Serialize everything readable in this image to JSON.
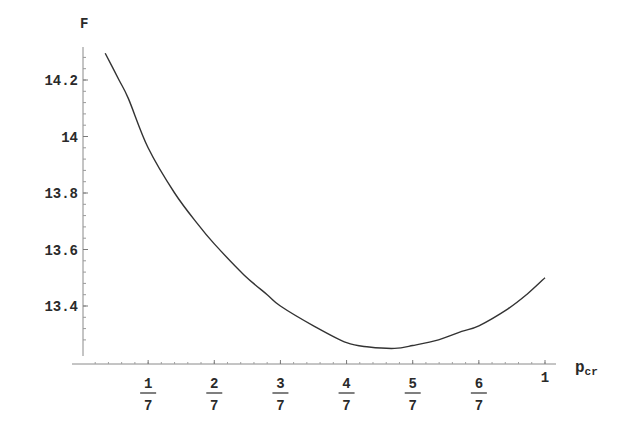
{
  "chart_data": {
    "type": "line",
    "title": "",
    "xlabel": "p",
    "xlabel_subscript": "cr",
    "ylabel": "F",
    "xlim": [
      0,
      1
    ],
    "ylim": [
      13.25,
      14.33
    ],
    "grid": false,
    "legend": null,
    "x_ticks": [
      {
        "value": 0.142857,
        "num": "1",
        "den": "7"
      },
      {
        "value": 0.285714,
        "num": "2",
        "den": "7"
      },
      {
        "value": 0.428571,
        "num": "3",
        "den": "7"
      },
      {
        "value": 0.571429,
        "num": "4",
        "den": "7"
      },
      {
        "value": 0.714286,
        "num": "5",
        "den": "7"
      },
      {
        "value": 0.857143,
        "num": "6",
        "den": "7"
      },
      {
        "value": 1.0,
        "label": "1"
      }
    ],
    "y_ticks": [
      {
        "value": 13.4,
        "label": "13.4"
      },
      {
        "value": 13.6,
        "label": "13.6"
      },
      {
        "value": 13.8,
        "label": "13.8"
      },
      {
        "value": 14.0,
        "label": "14"
      },
      {
        "value": 14.2,
        "label": "14.2"
      }
    ],
    "series": [
      {
        "name": "F",
        "color": "#333333",
        "x": [
          0.05,
          0.08,
          0.1,
          0.142857,
          0.2,
          0.25,
          0.285714,
          0.35,
          0.4,
          0.428571,
          0.5,
          0.571429,
          0.62,
          0.675,
          0.714286,
          0.77,
          0.82,
          0.857143,
          0.92,
          0.96,
          1.0
        ],
        "values": [
          14.295,
          14.2,
          14.135,
          13.96,
          13.8,
          13.69,
          13.62,
          13.51,
          13.44,
          13.4,
          13.33,
          13.27,
          13.255,
          13.25,
          13.26,
          13.28,
          13.31,
          13.33,
          13.39,
          13.44,
          13.5
        ]
      }
    ]
  }
}
